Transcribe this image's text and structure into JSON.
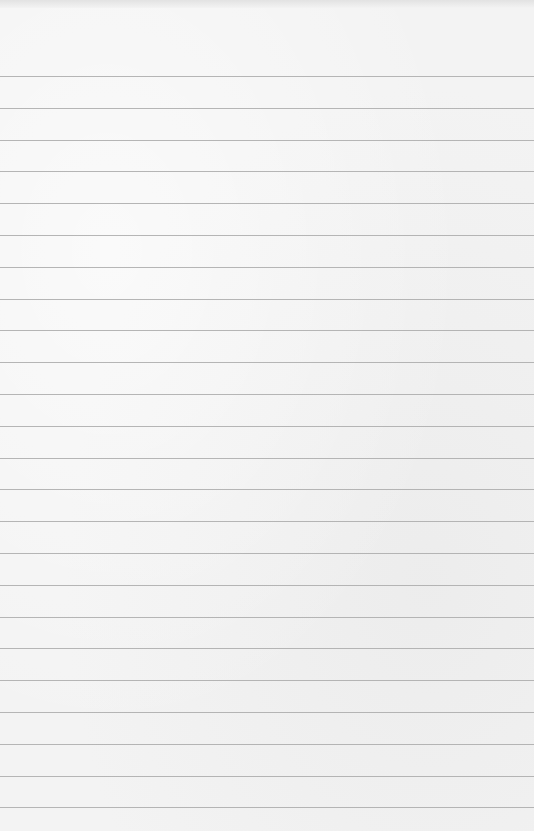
{
  "paper": {
    "type": "lined-paper",
    "background_color": "#f3f3f3",
    "rule_color": "#a9a9a9",
    "first_rule_y": 76,
    "rule_spacing": 31.8,
    "rule_count": 24
  }
}
